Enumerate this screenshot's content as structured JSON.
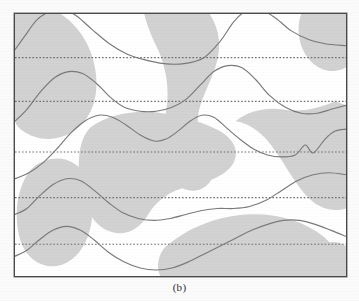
{
  "figure": {
    "caption": "(b)",
    "panel_label": "b",
    "frame": {
      "x": 14,
      "y": 13,
      "width": 333,
      "height": 264
    },
    "colors": {
      "shading": "#d2d2d2",
      "curve": "#7a7a7a",
      "baseline_dotted": "#6e6e6e",
      "frame_border": "#4a4a4a",
      "background": "#ffffff"
    }
  },
  "chart_data": {
    "type": "line",
    "title": "",
    "subtitle": "",
    "xlabel": "",
    "ylabel": "",
    "grid": false,
    "legend": null,
    "annotations": [
      "(b)"
    ],
    "axis_ticks_visible": false,
    "xlim": [
      0,
      333
    ],
    "ylim": [
      0,
      264
    ],
    "baselines": [
      {
        "index": 1,
        "y": 44
      },
      {
        "index": 2,
        "y": 88
      },
      {
        "index": 3,
        "y": 139
      },
      {
        "index": 4,
        "y": 185
      },
      {
        "index": 5,
        "y": 232
      }
    ],
    "series": [
      {
        "name": "trace-1",
        "baseline_y": 44,
        "points": [
          [
            0,
            36
          ],
          [
            10,
            22
          ],
          [
            22,
            6
          ],
          [
            34,
            -2
          ],
          [
            48,
            -5
          ],
          [
            62,
            2
          ],
          [
            78,
            16
          ],
          [
            95,
            30
          ],
          [
            112,
            40
          ],
          [
            130,
            46
          ],
          [
            150,
            50
          ],
          [
            170,
            50
          ],
          [
            190,
            44
          ],
          [
            206,
            28
          ],
          [
            220,
            8
          ],
          [
            232,
            -3
          ],
          [
            246,
            -5
          ],
          [
            262,
            4
          ],
          [
            278,
            17
          ],
          [
            296,
            26
          ],
          [
            312,
            30
          ],
          [
            333,
            32
          ]
        ]
      },
      {
        "name": "trace-2",
        "baseline_y": 88,
        "points": [
          [
            0,
            108
          ],
          [
            12,
            96
          ],
          [
            26,
            78
          ],
          [
            40,
            64
          ],
          [
            54,
            58
          ],
          [
            68,
            60
          ],
          [
            82,
            70
          ],
          [
            96,
            84
          ],
          [
            110,
            94
          ],
          [
            126,
            98
          ],
          [
            142,
            98
          ],
          [
            158,
            94
          ],
          [
            172,
            86
          ],
          [
            186,
            72
          ],
          [
            200,
            58
          ],
          [
            214,
            52
          ],
          [
            228,
            54
          ],
          [
            242,
            66
          ],
          [
            256,
            82
          ],
          [
            272,
            94
          ],
          [
            288,
            100
          ],
          [
            304,
            100
          ],
          [
            318,
            96
          ],
          [
            333,
            92
          ]
        ]
      },
      {
        "name": "trace-3",
        "baseline_y": 139,
        "points": [
          [
            0,
            166
          ],
          [
            14,
            160
          ],
          [
            28,
            150
          ],
          [
            42,
            136
          ],
          [
            56,
            120
          ],
          [
            70,
            108
          ],
          [
            84,
            102
          ],
          [
            98,
            104
          ],
          [
            112,
            112
          ],
          [
            126,
            122
          ],
          [
            140,
            128
          ],
          [
            152,
            126
          ],
          [
            164,
            118
          ],
          [
            176,
            108
          ],
          [
            188,
            102
          ],
          [
            200,
            104
          ],
          [
            212,
            114
          ],
          [
            226,
            126
          ],
          [
            240,
            136
          ],
          [
            254,
            142
          ],
          [
            268,
            144
          ],
          [
            282,
            142
          ],
          [
            292,
            132
          ],
          [
            300,
            140
          ],
          [
            312,
            126
          ],
          [
            322,
            118
          ],
          [
            333,
            116
          ]
        ]
      },
      {
        "name": "trace-4",
        "baseline_y": 185,
        "points": [
          [
            0,
            202
          ],
          [
            12,
            196
          ],
          [
            24,
            184
          ],
          [
            38,
            172
          ],
          [
            52,
            166
          ],
          [
            66,
            168
          ],
          [
            80,
            178
          ],
          [
            94,
            190
          ],
          [
            108,
            200
          ],
          [
            124,
            206
          ],
          [
            140,
            208
          ],
          [
            156,
            206
          ],
          [
            172,
            202
          ],
          [
            188,
            198
          ],
          [
            204,
            196
          ],
          [
            220,
            196
          ],
          [
            236,
            194
          ],
          [
            252,
            188
          ],
          [
            268,
            178
          ],
          [
            284,
            168
          ],
          [
            300,
            162
          ],
          [
            316,
            160
          ],
          [
            333,
            162
          ]
        ]
      },
      {
        "name": "trace-5",
        "baseline_y": 232,
        "points": [
          [
            0,
            244
          ],
          [
            12,
            238
          ],
          [
            24,
            228
          ],
          [
            38,
            218
          ],
          [
            52,
            214
          ],
          [
            66,
            218
          ],
          [
            80,
            228
          ],
          [
            94,
            240
          ],
          [
            110,
            250
          ],
          [
            126,
            256
          ],
          [
            142,
            258
          ],
          [
            158,
            256
          ],
          [
            174,
            250
          ],
          [
            190,
            242
          ],
          [
            206,
            234
          ],
          [
            222,
            226
          ],
          [
            238,
            218
          ],
          [
            254,
            212
          ],
          [
            270,
            208
          ],
          [
            286,
            208
          ],
          [
            302,
            212
          ],
          [
            318,
            218
          ],
          [
            333,
            224
          ]
        ]
      }
    ],
    "shaded_regions": [
      {
        "name": "region-upper-left",
        "centroid": [
          52,
          58
        ]
      },
      {
        "name": "region-upper-center-right",
        "centroid": [
          178,
          70
        ]
      },
      {
        "name": "region-right-upper",
        "centroid": [
          318,
          52
        ]
      },
      {
        "name": "region-center",
        "centroid": [
          150,
          140
        ]
      },
      {
        "name": "region-right-lower",
        "centroid": [
          300,
          170
        ]
      },
      {
        "name": "region-lower-left",
        "centroid": [
          45,
          205
        ]
      },
      {
        "name": "region-lower-center",
        "centroid": [
          200,
          250
        ]
      }
    ]
  }
}
